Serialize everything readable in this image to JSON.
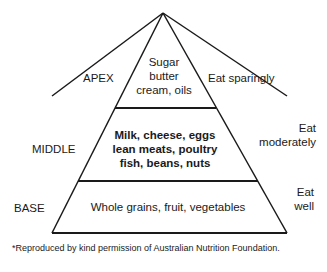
{
  "pyramid": {
    "levels": [
      {
        "label": "APEX",
        "foods": [
          "Sugar",
          "butter",
          "cream, oils"
        ],
        "advice": "Eat sparingly"
      },
      {
        "label": "MIDDLE",
        "foods": [
          "Milk, cheese, eggs",
          "lean meats, poultry",
          "fish, beans, nuts"
        ],
        "advice_lines": [
          "Eat",
          "moderately"
        ]
      },
      {
        "label": "BASE",
        "foods": [
          "Whole grains, fruit, vegetables"
        ],
        "advice_lines": [
          "Eat",
          "well"
        ]
      }
    ]
  },
  "footnote": "*Reproduced by kind permission of Australian Nutrition Foundation."
}
